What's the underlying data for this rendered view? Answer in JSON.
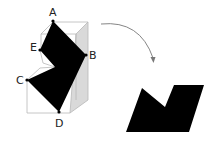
{
  "diagram": {
    "labels": {
      "A": "A",
      "B": "B",
      "C": "C",
      "D": "D",
      "E": "E"
    },
    "colors": {
      "shape_fill": "#000000",
      "box_line": "#b8b8b8",
      "box_face": "#d9d9d9",
      "arrow": "#777777",
      "label": "#222222"
    }
  }
}
